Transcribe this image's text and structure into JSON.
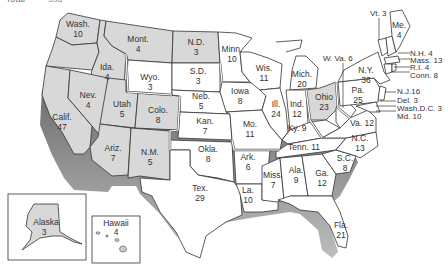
{
  "header": {
    "label": "Total",
    "value": "538"
  },
  "map": {
    "title": "Electoral votes by state",
    "colors": {
      "shaded": "#d8d8d8",
      "unshaded": "#ffffff",
      "border": "#333333",
      "shadow": "#8a8a8a"
    },
    "states": {
      "wash": {
        "name": "Wash.",
        "votes": "10"
      },
      "ore": {
        "name": "Ore.",
        "votes": "7"
      },
      "calif": {
        "name": "Calif.",
        "votes": "47"
      },
      "ida": {
        "name": "Ida.",
        "votes": "4"
      },
      "nev": {
        "name": "Nev.",
        "votes": "4"
      },
      "mont": {
        "name": "Mont.",
        "votes": "4"
      },
      "wyo": {
        "name": "Wyo.",
        "votes": "3"
      },
      "utah": {
        "name": "Utah",
        "votes": "5"
      },
      "colo": {
        "name": "Colo.",
        "votes": "8"
      },
      "ariz": {
        "name": "Ariz.",
        "votes": "7"
      },
      "nm": {
        "name": "N.M.",
        "votes": "5"
      },
      "nd": {
        "name": "N.D.",
        "votes": "3"
      },
      "sd": {
        "name": "S.D.",
        "votes": "3"
      },
      "neb": {
        "name": "Neb.",
        "votes": "5"
      },
      "kan": {
        "name": "Kan.",
        "votes": "7"
      },
      "okla": {
        "name": "Okla.",
        "votes": "8"
      },
      "tex": {
        "name": "Tex.",
        "votes": "29"
      },
      "minn": {
        "name": "Minn.",
        "votes": "10"
      },
      "iowa": {
        "name": "Iowa",
        "votes": "8"
      },
      "mo": {
        "name": "Mo.",
        "votes": "11"
      },
      "ark": {
        "name": "Ark.",
        "votes": "6"
      },
      "la": {
        "name": "La.",
        "votes": "10"
      },
      "wis": {
        "name": "Wis.",
        "votes": "11"
      },
      "ill": {
        "name": "Ill.",
        "votes": "24"
      },
      "mich": {
        "name": "Mich.",
        "votes": "20"
      },
      "ind": {
        "name": "Ind.",
        "votes": "12"
      },
      "ohio": {
        "name": "Ohio",
        "votes": "23"
      },
      "ky": {
        "name": "Ky.",
        "votes": "9"
      },
      "tenn": {
        "name": "Tenn.",
        "votes": "11"
      },
      "miss": {
        "name": "Miss.",
        "votes": "7"
      },
      "ala": {
        "name": "Ala.",
        "votes": "9"
      },
      "ga": {
        "name": "Ga.",
        "votes": "12"
      },
      "fla": {
        "name": "Fla.",
        "votes": "21"
      },
      "sc": {
        "name": "S.C.",
        "votes": "8"
      },
      "nc": {
        "name": "N.C.",
        "votes": "13"
      },
      "va": {
        "name": "Va.",
        "votes": "12"
      },
      "wva": {
        "name": "W. Va.",
        "votes": "6"
      },
      "pa": {
        "name": "Pa.",
        "votes": "25"
      },
      "ny": {
        "name": "N.Y.",
        "votes": "36"
      },
      "vt": {
        "name": "Vt.",
        "votes": "3"
      },
      "me": {
        "name": "Me.",
        "votes": "4"
      },
      "nh": {
        "name": "N.H.",
        "votes": "4"
      },
      "mass": {
        "name": "Mass.",
        "votes": "13"
      },
      "ri": {
        "name": "R.I.",
        "votes": "4"
      },
      "conn": {
        "name": "Conn.",
        "votes": "8"
      },
      "nj": {
        "name": "N.J.",
        "votes": "16"
      },
      "del": {
        "name": "Del.",
        "votes": "3"
      },
      "dc": {
        "name": "Wash.D.C.",
        "votes": "3"
      },
      "md": {
        "name": "Md.",
        "votes": "10"
      },
      "alaska": {
        "name": "Alaska",
        "votes": "3"
      },
      "hawaii": {
        "name": "Hawaii",
        "votes": "4"
      }
    },
    "callouts": {
      "vt": "Vt. 3",
      "wva": "W. Va. 6",
      "nh": "N.H. 4",
      "mass": "Mass. 13",
      "ri": "R.I. 4",
      "conn": "Conn. 8",
      "nj": "N.J.16",
      "del": "Del. 3",
      "dc": "Wash.D.C. 3",
      "md": "Md. 10",
      "ky": "Ky. 9",
      "tenn": "Tenn. 11",
      "va": "Va. 12"
    }
  }
}
